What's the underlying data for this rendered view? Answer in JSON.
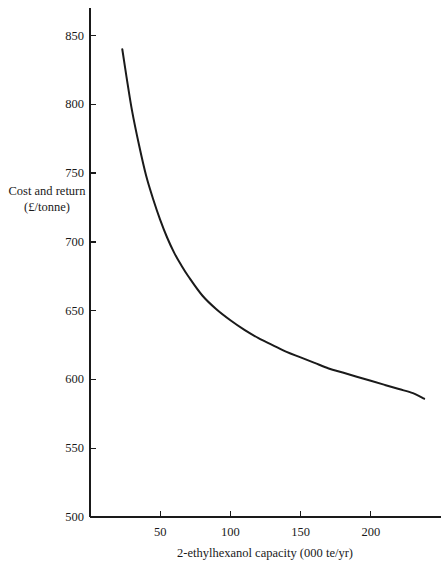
{
  "chart_data": {
    "type": "line",
    "title": "",
    "subtitle": "",
    "xlabel": "2-ethylhexanol capacity (000 te/yr)",
    "ylabel_line1": "Cost and return",
    "ylabel_line2": "(£/tonne)",
    "xlim": [
      0,
      250
    ],
    "ylim": [
      500,
      870
    ],
    "xticks": [
      50,
      100,
      150,
      200
    ],
    "xticklabels": [
      "50",
      "100",
      "150",
      "200"
    ],
    "yticks": [
      500,
      550,
      600,
      650,
      700,
      750,
      800,
      850
    ],
    "yticklabels": [
      "500",
      "550",
      "600",
      "650",
      "700",
      "750",
      "800",
      "850"
    ],
    "grid": false,
    "legend": null,
    "legend_position": "none",
    "series": [
      {
        "name": "Cost and return",
        "color": "#1a1a1a",
        "x": [
          23,
          26,
          30,
          35,
          40,
          45,
          50,
          55,
          60,
          65,
          70,
          80,
          90,
          100,
          110,
          120,
          130,
          140,
          150,
          160,
          170,
          180,
          190,
          200,
          210,
          220,
          230,
          238
        ],
        "y": [
          840,
          820,
          795,
          770,
          748,
          731,
          716,
          703,
          692,
          683,
          675,
          661,
          651,
          643,
          636,
          630,
          625,
          620,
          616,
          612,
          608,
          605,
          602,
          599,
          596,
          593,
          590,
          586
        ]
      }
    ],
    "annotations": []
  },
  "axes": {
    "y_axis_name": "y-axis",
    "x_axis_name": "x-axis"
  }
}
